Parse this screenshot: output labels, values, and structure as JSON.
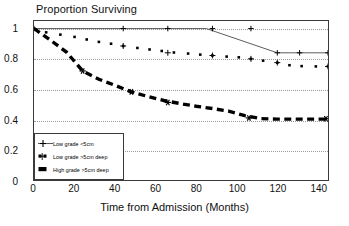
{
  "chart_data": {
    "type": "line",
    "title": "Proportion Surviving",
    "xlabel": "Time from Admission (Months)",
    "ylabel": "",
    "xlim": [
      0,
      145
    ],
    "ylim": [
      0,
      1.05
    ],
    "grid": true,
    "legend_position": "bottom-left",
    "xticks": [
      "0",
      "20",
      "40",
      "60",
      "80",
      "100",
      "120",
      "140"
    ],
    "xtick_values": [
      0,
      20,
      40,
      60,
      80,
      100,
      120,
      140
    ],
    "yticks": [
      "0",
      "0.2",
      "0.4",
      "0.6",
      "0.8",
      "1"
    ],
    "ytick_values": [
      0,
      0.2,
      0.4,
      0.6,
      0.8,
      1
    ],
    "gridline_values": [
      0.2,
      0.4,
      0.6,
      0.8,
      1.0
    ],
    "series": [
      {
        "name": "Low grade <5cm",
        "style": "solid-thin",
        "marker": "plus",
        "x": [
          0,
          85,
          120,
          145
        ],
        "values": [
          1.0,
          1.0,
          0.84,
          0.84
        ],
        "censor_x": [
          0,
          44,
          66,
          88,
          107,
          120,
          131,
          145
        ],
        "censor_y": [
          1.0,
          1.0,
          1.0,
          1.0,
          1.0,
          0.84,
          0.84,
          0.84
        ]
      },
      {
        "name": "Low grade >5cm deep",
        "style": "dotted-square",
        "marker": "square",
        "x": [
          0,
          6,
          13,
          20,
          26,
          32,
          38,
          44,
          51,
          57,
          63,
          69,
          76,
          82,
          88,
          95,
          101,
          107,
          113,
          120,
          126,
          132,
          139,
          145
        ],
        "values": [
          1.0,
          0.975,
          0.96,
          0.945,
          0.928,
          0.912,
          0.9,
          0.885,
          0.872,
          0.862,
          0.852,
          0.842,
          0.835,
          0.828,
          0.822,
          0.815,
          0.81,
          0.8,
          0.788,
          0.775,
          0.758,
          0.752,
          0.75,
          0.75
        ],
        "censor_x": [
          44,
          66,
          88,
          107,
          120,
          145
        ],
        "censor_y": [
          0.885,
          0.84,
          0.822,
          0.8,
          0.775,
          0.75
        ]
      },
      {
        "name": "High grade >5cm deep",
        "style": "dashed-thick",
        "marker": "asterisk",
        "x": [
          0,
          8,
          16,
          24,
          32,
          40,
          48,
          56,
          64,
          72,
          80,
          88,
          96,
          104,
          112,
          120,
          130,
          140,
          145
        ],
        "values": [
          1.0,
          0.925,
          0.845,
          0.72,
          0.665,
          0.625,
          0.582,
          0.552,
          0.525,
          0.505,
          0.487,
          0.472,
          0.455,
          0.425,
          0.405,
          0.402,
          0.402,
          0.402,
          0.402
        ],
        "censor_x": [
          24,
          48,
          66,
          106,
          144
        ],
        "censor_y": [
          0.72,
          0.582,
          0.512,
          0.41,
          0.405
        ]
      }
    ]
  },
  "legend": {
    "items": [
      {
        "label": "Low grade <5cm",
        "key": "plus-line-key"
      },
      {
        "label": "Low grade >5cm deep",
        "key": "square-dotted-key"
      },
      {
        "label": "High grade >5cm deep",
        "key": "thick-dash-key"
      }
    ]
  },
  "colors": {
    "axis": "#3a3a3a",
    "grid": "#9a9a9a",
    "series_1": "#303030",
    "series_2": "#000000",
    "series_3": "#000000",
    "background": "#ffffff"
  }
}
